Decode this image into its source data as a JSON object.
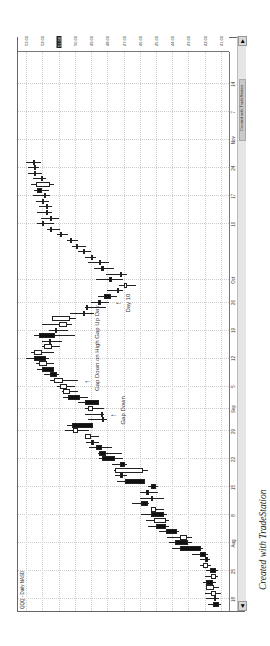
{
  "chart_data": {
    "type": "candlestick",
    "title": "QQQ - Daily NASD",
    "xlabel": "",
    "ylabel": "Price",
    "ylim": [
      40.5,
      53.5
    ],
    "price_ticks": [
      "53.00",
      "52.00",
      "51.00",
      "50.00",
      "49.00",
      "48.00",
      "47.00",
      "46.00",
      "45.00",
      "44.00",
      "43.00",
      "42.00",
      "41.00"
    ],
    "highlighted_price": "51.00",
    "date_ticks": [
      {
        "label": "18",
        "bar": 1
      },
      {
        "label": "25",
        "bar": 6
      },
      {
        "label": "Aug",
        "bar": 11
      },
      {
        "label": "8",
        "bar": 16
      },
      {
        "label": "15",
        "bar": 21
      },
      {
        "label": "22",
        "bar": 26
      },
      {
        "label": "29",
        "bar": 31
      },
      {
        "label": "Sep",
        "bar": 35
      },
      {
        "label": "5",
        "bar": 39
      },
      {
        "label": "12",
        "bar": 44
      },
      {
        "label": "19",
        "bar": 49
      },
      {
        "label": "26",
        "bar": 54
      },
      {
        "label": "Oct",
        "bar": 58
      },
      {
        "label": "10",
        "bar": 68
      },
      {
        "label": "17",
        "bar": 73
      },
      {
        "label": "24",
        "bar": 78
      },
      {
        "label": "Nov",
        "bar": 83
      },
      {
        "label": "7",
        "bar": 88
      },
      {
        "label": "14",
        "bar": 93
      }
    ],
    "grid": true,
    "bars": [
      {
        "o": 41.5,
        "h": 41.8,
        "l": 41.0,
        "c": 41.1
      },
      {
        "o": 41.4,
        "h": 41.9,
        "l": 41.1,
        "c": 41.4
      },
      {
        "o": 41.3,
        "h": 42.0,
        "l": 41.0,
        "c": 41.6
      },
      {
        "o": 41.4,
        "h": 41.9,
        "l": 41.1,
        "c": 41.9
      },
      {
        "o": 41.9,
        "h": 42.1,
        "l": 41.3,
        "c": 41.5
      },
      {
        "o": 41.3,
        "h": 42.0,
        "l": 41.2,
        "c": 41.6
      },
      {
        "o": 41.7,
        "h": 41.9,
        "l": 41.2,
        "c": 41.3
      },
      {
        "o": 41.8,
        "h": 42.3,
        "l": 41.6,
        "c": 42.1
      },
      {
        "o": 42.0,
        "h": 42.3,
        "l": 41.7,
        "c": 41.8
      },
      {
        "o": 42.3,
        "h": 42.8,
        "l": 41.8,
        "c": 41.9
      },
      {
        "o": 43.5,
        "h": 44.0,
        "l": 42.1,
        "c": 42.2
      },
      {
        "o": 43.8,
        "h": 44.2,
        "l": 42.8,
        "c": 43.0
      },
      {
        "o": 43.1,
        "h": 44.3,
        "l": 42.8,
        "c": 43.5
      },
      {
        "o": 44.4,
        "h": 44.8,
        "l": 43.6,
        "c": 43.7
      },
      {
        "o": 45.0,
        "h": 45.5,
        "l": 44.2,
        "c": 44.4
      },
      {
        "o": 44.4,
        "h": 45.6,
        "l": 44.2,
        "c": 45.1
      },
      {
        "o": 45.3,
        "h": 45.9,
        "l": 44.3,
        "c": 44.5
      },
      {
        "o": 45.0,
        "h": 45.3,
        "l": 44.5,
        "c": 45.3
      },
      {
        "o": 45.9,
        "h": 46.5,
        "l": 45.4,
        "c": 45.5
      },
      {
        "o": 45.3,
        "h": 46.0,
        "l": 44.5,
        "c": 45.3
      },
      {
        "o": 45.6,
        "h": 46.0,
        "l": 44.9,
        "c": 45.4
      },
      {
        "o": 45.3,
        "h": 45.5,
        "l": 44.9,
        "c": 45.0
      },
      {
        "o": 46.9,
        "h": 47.4,
        "l": 45.7,
        "c": 45.7
      },
      {
        "o": 47.2,
        "h": 47.5,
        "l": 46.8,
        "c": 47.0
      },
      {
        "o": 45.8,
        "h": 47.6,
        "l": 45.5,
        "c": 47.5
      },
      {
        "o": 47.2,
        "h": 47.7,
        "l": 46.8,
        "c": 46.9
      },
      {
        "o": 48.3,
        "h": 48.5,
        "l": 47.0,
        "c": 47.5
      },
      {
        "o": 48.5,
        "h": 48.6,
        "l": 47.1,
        "c": 48.1
      },
      {
        "o": 48.7,
        "h": 49.1,
        "l": 47.7,
        "c": 48.3
      },
      {
        "o": 49.0,
        "h": 49.3,
        "l": 48.5,
        "c": 48.8
      },
      {
        "o": 49.0,
        "h": 49.4,
        "l": 48.5,
        "c": 49.4
      },
      {
        "o": 49.8,
        "h": 50.6,
        "l": 49.1,
        "c": 50.1
      },
      {
        "o": 50.2,
        "h": 50.5,
        "l": 48.9,
        "c": 48.9
      },
      {
        "o": 48.3,
        "h": 49.2,
        "l": 48.0,
        "c": 48.3
      },
      {
        "o": 48.4,
        "h": 49.4,
        "l": 48.2,
        "c": 48.4
      },
      {
        "o": 48.9,
        "h": 49.4,
        "l": 48.2,
        "c": 49.2
      },
      {
        "o": 49.4,
        "h": 49.8,
        "l": 48.5,
        "c": 48.5
      },
      {
        "o": 50.4,
        "h": 50.7,
        "l": 49.2,
        "c": 49.7
      },
      {
        "o": 50.3,
        "h": 50.8,
        "l": 49.8,
        "c": 50.7
      },
      {
        "o": 50.5,
        "h": 51.1,
        "l": 50.0,
        "c": 50.9
      },
      {
        "o": 50.7,
        "h": 51.5,
        "l": 49.8,
        "c": 51.3
      },
      {
        "o": 51.5,
        "h": 51.9,
        "l": 51.0,
        "c": 51.1
      },
      {
        "o": 52.0,
        "h": 52.3,
        "l": 51.3,
        "c": 51.3
      },
      {
        "o": 51.7,
        "h": 52.4,
        "l": 51.3,
        "c": 52.2
      },
      {
        "o": 52.5,
        "h": 53.0,
        "l": 51.6,
        "c": 51.8
      },
      {
        "o": 52.0,
        "h": 52.7,
        "l": 51.3,
        "c": 52.5
      },
      {
        "o": 51.4,
        "h": 52.0,
        "l": 50.9,
        "c": 51.9
      },
      {
        "o": 51.6,
        "h": 52.0,
        "l": 50.8,
        "c": 51.6
      },
      {
        "o": 52.2,
        "h": 52.5,
        "l": 50.0,
        "c": 51.2
      },
      {
        "o": 51.2,
        "h": 51.6,
        "l": 50.4,
        "c": 51.2
      },
      {
        "o": 50.5,
        "h": 52.0,
        "l": 50.2,
        "c": 51.0
      },
      {
        "o": 50.3,
        "h": 51.2,
        "l": 49.9,
        "c": 51.4
      },
      {
        "o": 49.5,
        "h": 50.3,
        "l": 48.8,
        "c": 49.5
      },
      {
        "o": 49.2,
        "h": 49.4,
        "l": 48.1,
        "c": 49.3
      },
      {
        "o": 48.6,
        "h": 49.0,
        "l": 47.9,
        "c": 48.4
      },
      {
        "o": 48.2,
        "h": 48.6,
        "l": 47.4,
        "c": 47.8
      },
      {
        "o": 47.4,
        "h": 48.0,
        "l": 47.0,
        "c": 47.4
      },
      {
        "o": 46.8,
        "h": 47.3,
        "l": 46.2,
        "c": 47.0
      },
      {
        "o": 47.9,
        "h": 48.7,
        "l": 47.0,
        "c": 47.7
      },
      {
        "o": 47.2,
        "h": 48.1,
        "l": 46.8,
        "c": 47.2
      },
      {
        "o": 48.4,
        "h": 48.8,
        "l": 47.6,
        "c": 48.2
      },
      {
        "o": 48.5,
        "h": 49.2,
        "l": 47.9,
        "c": 48.4
      },
      {
        "o": 49.0,
        "h": 49.4,
        "l": 48.7,
        "c": 49.0
      },
      {
        "o": 49.5,
        "h": 49.8,
        "l": 49.0,
        "c": 49.5
      },
      {
        "o": 49.9,
        "h": 50.2,
        "l": 49.3,
        "c": 49.9
      },
      {
        "o": 50.3,
        "h": 50.5,
        "l": 49.8,
        "c": 50.3
      },
      {
        "o": 50.9,
        "h": 51.1,
        "l": 50.4,
        "c": 50.9
      },
      {
        "o": 51.5,
        "h": 51.7,
        "l": 50.9,
        "c": 51.5
      },
      {
        "o": 52.0,
        "h": 52.3,
        "l": 51.3,
        "c": 52.0
      },
      {
        "o": 51.5,
        "h": 52.1,
        "l": 51.0,
        "c": 51.4
      },
      {
        "o": 51.8,
        "h": 52.3,
        "l": 51.4,
        "c": 51.8
      },
      {
        "o": 51.8,
        "h": 52.2,
        "l": 51.4,
        "c": 51.8
      },
      {
        "o": 52.0,
        "h": 52.4,
        "l": 51.6,
        "c": 52.0
      },
      {
        "o": 51.9,
        "h": 52.6,
        "l": 51.5,
        "c": 51.9
      },
      {
        "o": 52.3,
        "h": 52.5,
        "l": 51.6,
        "c": 52.0
      },
      {
        "o": 51.5,
        "h": 52.7,
        "l": 51.3,
        "c": 52.4
      },
      {
        "o": 52.1,
        "h": 52.6,
        "l": 51.8,
        "c": 52.1
      },
      {
        "o": 52.5,
        "h": 52.9,
        "l": 52.0,
        "c": 52.5
      },
      {
        "o": 52.5,
        "h": 52.9,
        "l": 52.2,
        "c": 52.5
      },
      {
        "o": 52.6,
        "h": 53.0,
        "l": 52.1,
        "c": 52.6
      }
    ],
    "annotations": [
      {
        "text": "Gap Down",
        "bar": 34
      },
      {
        "text": "Gap Down on High Gap Up Day",
        "bar": 40
      },
      {
        "text": "Day 10",
        "bar": 54
      }
    ]
  },
  "header": {
    "symbol_label": "QQQ - Daily  NASD"
  },
  "footer": {
    "credit": "Created with TradeStation",
    "box_credit": "Created with TradeStation"
  },
  "colors": {
    "up_fill": "#ffffff",
    "down_fill": "#111111",
    "outline": "#222222",
    "grid": "#cccccc"
  }
}
